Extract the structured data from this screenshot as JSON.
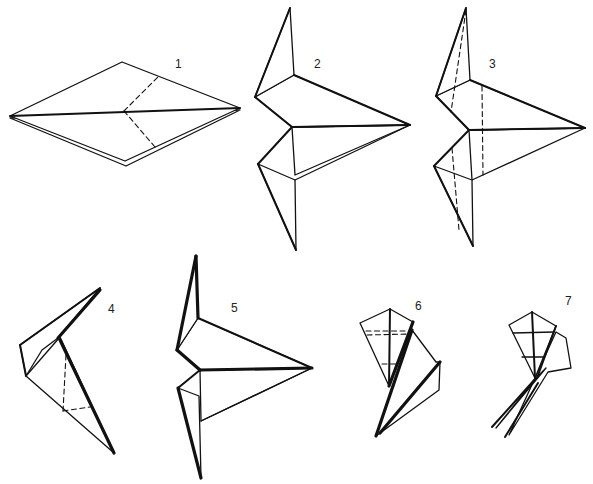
{
  "figure": {
    "title": "",
    "line_color": "#111111",
    "background": "#ffffff"
  },
  "steps": [
    {
      "label": "1",
      "fold_type": "valley-fold-lines"
    },
    {
      "label": "2",
      "fold_type": "reverse-fold-result"
    },
    {
      "label": "3",
      "fold_type": "valley-fold-lines"
    },
    {
      "label": "4",
      "fold_type": "valley-fold-lines"
    },
    {
      "label": "5",
      "fold_type": "result"
    },
    {
      "label": "6",
      "fold_type": "valley-fold-lines"
    },
    {
      "label": "7",
      "fold_type": "result"
    }
  ]
}
